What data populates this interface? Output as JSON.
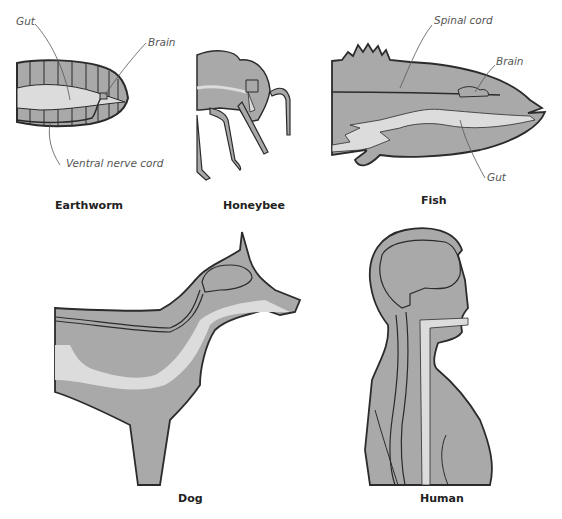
{
  "colors": {
    "body_fill": "#a9a9a9",
    "gut_fill": "#dcdcdc",
    "outline": "#2b2b2b",
    "label_text": "#555555",
    "caption_text": "#222222"
  },
  "panels": {
    "earthworm": {
      "caption": "Earthworm",
      "labels": {
        "gut": "Gut",
        "brain": "Brain",
        "ventral_nerve_cord": "Ventral nerve cord"
      }
    },
    "honeybee": {
      "caption": "Honeybee"
    },
    "fish": {
      "caption": "Fish",
      "labels": {
        "spinal_cord": "Spinal cord",
        "brain": "Brain",
        "gut": "Gut"
      }
    },
    "dog": {
      "caption": "Dog"
    },
    "human": {
      "caption": "Human"
    }
  }
}
